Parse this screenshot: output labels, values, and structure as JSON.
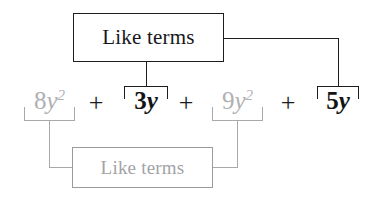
{
  "diagram": {
    "title_top": "Like terms",
    "title_bottom": "Like terms",
    "colors": {
      "dark": "#1d1d1d",
      "gray": "#a9a9ac",
      "gray_text": "#a3a3a6",
      "background": "#ffffff"
    },
    "expression": {
      "full": "8y^2 + 3y + 9y^2 + 5y",
      "operators": [
        "+",
        "+",
        "+"
      ],
      "terms": [
        {
          "id": "term-8y2",
          "coefficient": "8",
          "variable": "y",
          "exponent": "2",
          "emphasis": "gray",
          "group": "bottom"
        },
        {
          "id": "term-3y",
          "coefficient": "3",
          "variable": "y",
          "exponent": "",
          "emphasis": "dark",
          "group": "top"
        },
        {
          "id": "term-9y2",
          "coefficient": "9",
          "variable": "y",
          "exponent": "2",
          "emphasis": "gray",
          "group": "bottom"
        },
        {
          "id": "term-5y",
          "coefficient": "5",
          "variable": "y",
          "exponent": "",
          "emphasis": "dark",
          "group": "top"
        }
      ]
    },
    "groups": {
      "top": {
        "label": "Like terms",
        "members": [
          "3y",
          "5y"
        ],
        "emphasis": "dark"
      },
      "bottom": {
        "label": "Like terms",
        "members": [
          "8y^2",
          "9y^2"
        ],
        "emphasis": "gray"
      }
    }
  }
}
